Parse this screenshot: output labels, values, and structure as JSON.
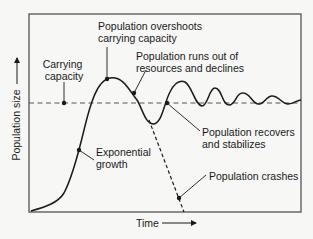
{
  "diagram": {
    "axes": {
      "y_label": "Population size",
      "x_label": "Time"
    },
    "annotations": [
      {
        "id": "carrying-capacity",
        "lines": [
          "Carrying",
          "capacity"
        ]
      },
      {
        "id": "overshoot",
        "lines": [
          "Population overshoots",
          "carrying capacity"
        ]
      },
      {
        "id": "runs-out",
        "lines": [
          "Population runs out of",
          "resources and declines"
        ]
      },
      {
        "id": "recovers",
        "lines": [
          "Population recovers",
          "and stabilizes"
        ]
      },
      {
        "id": "exponential",
        "lines": [
          "Exponential",
          "growth"
        ]
      },
      {
        "id": "crashes",
        "lines": [
          "Population crashes"
        ]
      }
    ],
    "colors": {
      "background": "#f7f7f5",
      "line": "#1a1a1a",
      "frame": "#555555",
      "dashed": "#555555"
    }
  }
}
